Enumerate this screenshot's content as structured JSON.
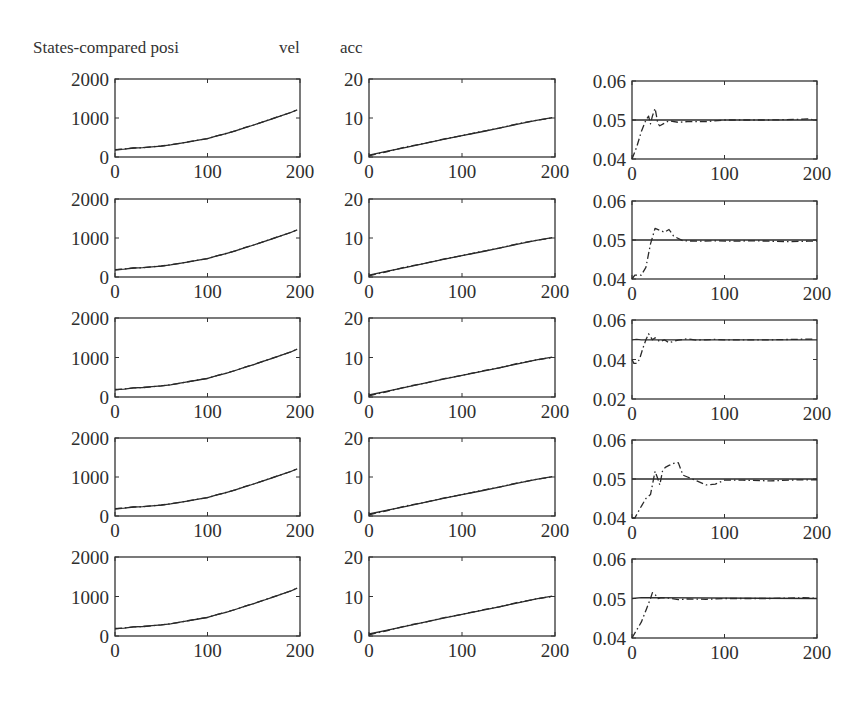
{
  "header": {
    "title": "States-compared posi",
    "col2_label": "vel",
    "col3_label": "acc"
  },
  "chart_data": [
    {
      "type": "line",
      "title": "posi",
      "grid_position": "column 1 (rows 1-5, identical style)",
      "rows": 5,
      "xlim": [
        0,
        200
      ],
      "ylim": [
        0,
        2000
      ],
      "xticks": [
        "0",
        "100",
        "200"
      ],
      "yticks": [
        "0",
        "1000",
        "2000"
      ],
      "series": [
        {
          "name": "true (solid)",
          "style": "solid",
          "x": [
            0,
            10,
            20,
            30,
            40,
            50,
            60,
            70,
            80,
            90,
            100,
            110,
            120,
            130,
            140,
            150,
            160,
            170,
            180,
            190,
            197
          ],
          "values": [
            190,
            200,
            230,
            240,
            260,
            280,
            310,
            350,
            390,
            430,
            470,
            540,
            600,
            670,
            750,
            820,
            900,
            980,
            1060,
            1140,
            1210
          ]
        },
        {
          "name": "estimate (dash-dot)",
          "style": "dashdot",
          "x": [
            0,
            10,
            20,
            30,
            40,
            50,
            60,
            70,
            80,
            90,
            100,
            110,
            120,
            130,
            140,
            150,
            160,
            170,
            180,
            190,
            197
          ],
          "values": [
            180,
            205,
            230,
            238,
            262,
            282,
            312,
            348,
            392,
            432,
            468,
            542,
            602,
            672,
            752,
            822,
            902,
            982,
            1062,
            1142,
            1212
          ]
        }
      ]
    },
    {
      "type": "line",
      "title": "vel",
      "grid_position": "column 2 (rows 1-5, identical style)",
      "rows": 5,
      "xlim": [
        0,
        200
      ],
      "ylim": [
        0,
        20
      ],
      "xticks": [
        "0",
        "100",
        "200"
      ],
      "yticks": [
        "0",
        "10",
        "20"
      ],
      "series": [
        {
          "name": "true (solid)",
          "style": "solid",
          "x": [
            0,
            20,
            40,
            60,
            80,
            100,
            120,
            140,
            160,
            180,
            197
          ],
          "values": [
            0.5,
            1.5,
            2.5,
            3.5,
            4.5,
            5.5,
            6.4,
            7.4,
            8.4,
            9.4,
            10.1
          ]
        },
        {
          "name": "estimate (dash-dot)",
          "style": "dashdot",
          "x": [
            0,
            20,
            40,
            60,
            80,
            100,
            120,
            140,
            160,
            180,
            197
          ],
          "values": [
            0.3,
            1.4,
            2.6,
            3.5,
            4.6,
            5.5,
            6.5,
            7.4,
            8.5,
            9.4,
            10.0
          ]
        }
      ]
    },
    {
      "type": "line",
      "title": "acc",
      "grid_position": "column 3",
      "xlim": [
        0,
        200
      ],
      "xticks": [
        "0",
        "100",
        "200"
      ],
      "rows": [
        {
          "row": 1,
          "ylim": [
            0.04,
            0.06
          ],
          "yticks": [
            "0.04",
            "0.05",
            "0.06"
          ],
          "series": [
            {
              "name": "true (solid)",
              "style": "solid",
              "x": [
                0,
                200
              ],
              "values": [
                0.05,
                0.05
              ]
            },
            {
              "name": "estimate (dash-dot)",
              "style": "dashdot",
              "x": [
                0,
                5,
                10,
                15,
                18,
                20,
                22,
                25,
                28,
                30,
                40,
                50,
                60,
                80,
                100,
                150,
                185,
                190,
                195,
                200
              ],
              "values": [
                0.04,
                0.043,
                0.047,
                0.05,
                0.051,
                0.049,
                0.051,
                0.053,
                0.049,
                0.0485,
                0.0498,
                0.0494,
                0.0496,
                0.0496,
                0.05,
                0.05,
                0.0502,
                0.0503,
                0.0501,
                0.05
              ]
            }
          ]
        },
        {
          "row": 2,
          "ylim": [
            0.04,
            0.06
          ],
          "yticks": [
            "0.04",
            "0.05",
            "0.06"
          ],
          "series": [
            {
              "name": "true (solid)",
              "style": "solid",
              "x": [
                0,
                200
              ],
              "values": [
                0.05,
                0.05
              ]
            },
            {
              "name": "estimate (dash-dot)",
              "style": "dashdot",
              "x": [
                0,
                3,
                10,
                15,
                20,
                25,
                30,
                35,
                40,
                45,
                55,
                70,
                90,
                110,
                130,
                150,
                170,
                190,
                200
              ],
              "values": [
                0.04,
                0.041,
                0.041,
                0.043,
                0.049,
                0.053,
                0.0525,
                0.052,
                0.0527,
                0.051,
                0.0498,
                0.0497,
                0.0498,
                0.0497,
                0.0498,
                0.0497,
                0.0496,
                0.0497,
                0.0497
              ]
            }
          ]
        },
        {
          "row": 3,
          "ylim": [
            0.02,
            0.06
          ],
          "yticks": [
            "0.02",
            "0.04",
            "0.06"
          ],
          "series": [
            {
              "name": "true (solid)",
              "style": "solid",
              "x": [
                0,
                5,
                10,
                200
              ],
              "values": [
                0.05,
                0.0502,
                0.05,
                0.05
              ]
            },
            {
              "name": "estimate (dash-dot)",
              "style": "dashdot",
              "x": [
                0,
                2,
                5,
                8,
                12,
                15,
                18,
                22,
                25,
                30,
                35,
                40,
                50,
                60,
                70,
                80,
                90,
                100,
                150,
                185,
                195
              ],
              "values": [
                0.04,
                0.038,
                0.038,
                0.04,
                0.046,
                0.05,
                0.053,
                0.05,
                0.051,
                0.049,
                0.05,
                0.0485,
                0.0498,
                0.0505,
                0.0498,
                0.05,
                0.0502,
                0.05,
                0.05,
                0.0503,
                0.0503
              ]
            }
          ]
        },
        {
          "row": 4,
          "ylim": [
            0.04,
            0.06
          ],
          "yticks": [
            "0.04",
            "0.05",
            "0.06"
          ],
          "series": [
            {
              "name": "true (solid)",
              "style": "solid",
              "x": [
                0,
                200
              ],
              "values": [
                0.05,
                0.05
              ]
            },
            {
              "name": "estimate (dash-dot)",
              "style": "dashdot",
              "x": [
                0,
                3,
                10,
                15,
                20,
                25,
                28,
                30,
                33,
                36,
                40,
                45,
                50,
                55,
                60,
                70,
                80,
                90,
                100,
                120,
                150,
                180,
                200
              ],
              "values": [
                0.04,
                0.04,
                0.043,
                0.045,
                0.046,
                0.052,
                0.05,
                0.0485,
                0.052,
                0.053,
                0.0535,
                0.054,
                0.0542,
                0.051,
                0.0505,
                0.0495,
                0.0485,
                0.0487,
                0.0497,
                0.0497,
                0.0495,
                0.0498,
                0.0498
              ]
            }
          ]
        },
        {
          "row": 5,
          "ylim": [
            0.04,
            0.06
          ],
          "yticks": [
            "0.04",
            "0.05",
            "0.06"
          ],
          "series": [
            {
              "name": "true (solid)",
              "style": "solid",
              "x": [
                0,
                10,
                200
              ],
              "values": [
                0.05,
                0.0502,
                0.05
              ]
            },
            {
              "name": "estimate (dash-dot)",
              "style": "dashdot",
              "x": [
                0,
                5,
                10,
                15,
                20,
                22,
                25,
                28,
                32,
                40,
                50,
                60,
                80,
                100,
                150,
                185,
                195,
                200
              ],
              "values": [
                0.04,
                0.042,
                0.044,
                0.047,
                0.05,
                0.0515,
                0.051,
                0.05,
                0.0502,
                0.0501,
                0.0497,
                0.0499,
                0.0498,
                0.05,
                0.05,
                0.0502,
                0.0501,
                0.05
              ]
            }
          ]
        }
      ]
    }
  ]
}
